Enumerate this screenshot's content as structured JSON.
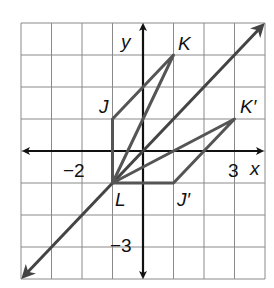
{
  "figure": {
    "type": "coordinate-plane-dilation",
    "axes": {
      "x_label": "x",
      "y_label": "y",
      "x_range": [
        -4,
        4
      ],
      "y_range": [
        -4,
        4
      ]
    },
    "tick_labels": {
      "x_neg": "−2",
      "x_pos": "3",
      "y_neg": "−3"
    },
    "points": {
      "J": {
        "label": "J",
        "coords": [
          -1,
          1
        ]
      },
      "K": {
        "label": "K",
        "coords": [
          1,
          3
        ]
      },
      "L": {
        "label": "L",
        "coords": [
          -1,
          -1
        ]
      },
      "J_prime": {
        "label": "J′",
        "coords": [
          1,
          -1
        ]
      },
      "K_prime": {
        "label": "K′",
        "coords": [
          3,
          1
        ]
      }
    },
    "line": {
      "equation": "y = x"
    },
    "colors": {
      "grid": "#8a8a8a",
      "axes": "#111111",
      "figure": "#555555"
    }
  }
}
